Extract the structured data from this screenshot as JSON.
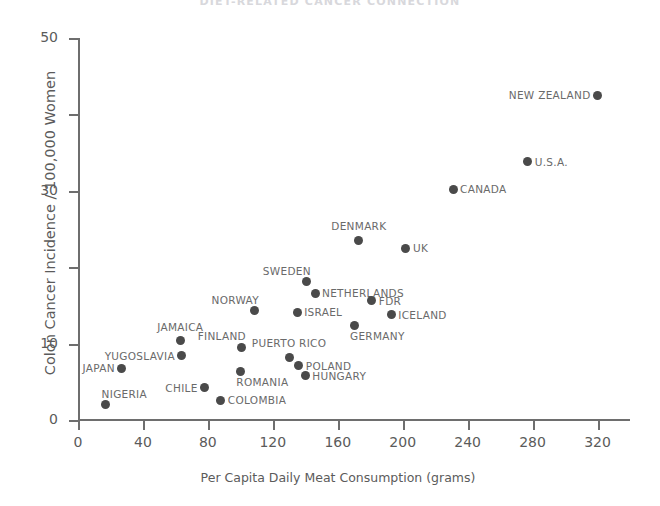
{
  "chart_data": {
    "type": "scatter",
    "title": "DIET-RELATED CANCER CONNECTION",
    "xlabel": "Per Capita Daily Meat Consumption (grams)",
    "ylabel": "Colon Cancer Incidence / 100,000 Women",
    "xlim": [
      0,
      340
    ],
    "ylim": [
      0,
      50
    ],
    "xticks": [
      0,
      40,
      80,
      120,
      160,
      200,
      240,
      280,
      320
    ],
    "xtick_labels": [
      "0",
      "40",
      "80",
      "120",
      "160",
      "200",
      "240",
      "280",
      "320"
    ],
    "yticks": [
      0,
      10,
      20,
      30,
      40,
      50
    ],
    "ytick_labels": [
      "0",
      "10",
      "",
      "30",
      "",
      "50"
    ],
    "grid": false,
    "legend": false,
    "marker_color": "#4a4a4a",
    "axis_color": "#6e6e6e",
    "points": [
      {
        "label": "NIGERIA",
        "x": 17,
        "y": 2.0,
        "label_pos": "above-right"
      },
      {
        "label": "JAPAN",
        "x": 27,
        "y": 6.8,
        "label_pos": "left"
      },
      {
        "label": "YUGOSLAVIA",
        "x": 64,
        "y": 8.4,
        "label_pos": "left"
      },
      {
        "label": "JAMAICA",
        "x": 63,
        "y": 10.4,
        "label_pos": "above"
      },
      {
        "label": "CHILE",
        "x": 78,
        "y": 4.2,
        "label_pos": "left"
      },
      {
        "label": "COLOMBIA",
        "x": 88,
        "y": 2.6,
        "label_pos": "right"
      },
      {
        "label": "ROMANIA",
        "x": 100,
        "y": 6.4,
        "label_pos": "below-right"
      },
      {
        "label": "FINLAND",
        "x": 101,
        "y": 9.5,
        "label_pos": "above-left"
      },
      {
        "label": "NORWAY",
        "x": 109,
        "y": 14.3,
        "label_pos": "above-left"
      },
      {
        "label": "ISRAEL",
        "x": 135,
        "y": 14.1,
        "label_pos": "right"
      },
      {
        "label": "PUERTO RICO",
        "x": 130,
        "y": 8.2,
        "label_pos": "above"
      },
      {
        "label": "SWEDEN",
        "x": 141,
        "y": 18.1,
        "label_pos": "above-left"
      },
      {
        "label": "NETHERLANDS",
        "x": 146,
        "y": 16.6,
        "label_pos": "right"
      },
      {
        "label": "POLAND",
        "x": 136,
        "y": 7.1,
        "label_pos": "right"
      },
      {
        "label": "HUNGARY",
        "x": 140,
        "y": 5.8,
        "label_pos": "right"
      },
      {
        "label": "GERMANY",
        "x": 170,
        "y": 12.4,
        "label_pos": "below-right"
      },
      {
        "label": "DENMARK",
        "x": 173,
        "y": 23.5,
        "label_pos": "above"
      },
      {
        "label": "FDR",
        "x": 181,
        "y": 15.6,
        "label_pos": "right"
      },
      {
        "label": "UK",
        "x": 202,
        "y": 22.5,
        "label_pos": "right"
      },
      {
        "label": "ICELAND",
        "x": 193,
        "y": 13.8,
        "label_pos": "right"
      },
      {
        "label": "CANADA",
        "x": 231,
        "y": 30.2,
        "label_pos": "right"
      },
      {
        "label": "U.S.A.",
        "x": 277,
        "y": 33.8,
        "label_pos": "right"
      },
      {
        "label": "NEW ZEALAND",
        "x": 320,
        "y": 42.5,
        "label_pos": "left"
      }
    ]
  }
}
